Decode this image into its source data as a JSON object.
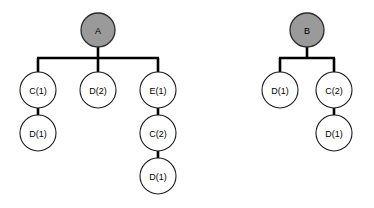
{
  "diagram": {
    "type": "tree-diagram",
    "title": "",
    "background_color": "#ffffff",
    "edge_color": "#000000",
    "node_fill_default": "#ffffff",
    "node_fill_root": "#9a9a9a",
    "node_stroke": "#1a1a1a",
    "node_radius": 18,
    "root_radius": 17,
    "trees": [
      {
        "name": "tree-a",
        "root": {
          "id": "a-root",
          "label": "A",
          "x": 98,
          "y": 30,
          "r": 17,
          "filled": true
        },
        "nodes": [
          {
            "id": "a-c1",
            "label": "C(1)",
            "x": 38,
            "y": 90,
            "r": 18,
            "filled": false
          },
          {
            "id": "a-d1-under-c1",
            "label": "D(1)",
            "x": 38,
            "y": 133,
            "r": 18,
            "filled": false
          },
          {
            "id": "a-d2",
            "label": "D(2)",
            "x": 98,
            "y": 90,
            "r": 18,
            "filled": false
          },
          {
            "id": "a-e1",
            "label": "E(1)",
            "x": 158,
            "y": 90,
            "r": 18,
            "filled": false
          },
          {
            "id": "a-c2",
            "label": "C(2)",
            "x": 158,
            "y": 133,
            "r": 18,
            "filled": false
          },
          {
            "id": "a-d1-bottom",
            "label": "D(1)",
            "x": 158,
            "y": 176,
            "r": 18,
            "filled": false
          }
        ],
        "bus": {
          "y": 58,
          "x_left": 38,
          "x_right": 158,
          "stem_x": 98,
          "stem_top": 47
        }
      },
      {
        "name": "tree-b",
        "root": {
          "id": "b-root",
          "label": "B",
          "x": 307,
          "y": 30,
          "r": 17,
          "filled": true
        },
        "nodes": [
          {
            "id": "b-d1",
            "label": "D(1)",
            "x": 280,
            "y": 90,
            "r": 18,
            "filled": false
          },
          {
            "id": "b-c2",
            "label": "C(2)",
            "x": 334,
            "y": 90,
            "r": 18,
            "filled": false
          },
          {
            "id": "b-d1-under-c2",
            "label": "D(1)",
            "x": 334,
            "y": 133,
            "r": 18,
            "filled": false
          }
        ],
        "bus": {
          "y": 58,
          "x_left": 280,
          "x_right": 334,
          "stem_x": 307,
          "stem_top": 47
        }
      }
    ],
    "labels": {
      "a_root": "A",
      "a_c1": "C(1)",
      "a_d1_under_c1": "D(1)",
      "a_d2": "D(2)",
      "a_e1": "E(1)",
      "a_c2": "C(2)",
      "a_d1_bottom": "D(1)",
      "b_root": "B",
      "b_d1": "D(1)",
      "b_c2": "C(2)",
      "b_d1_under_c2": "D(1)"
    }
  }
}
